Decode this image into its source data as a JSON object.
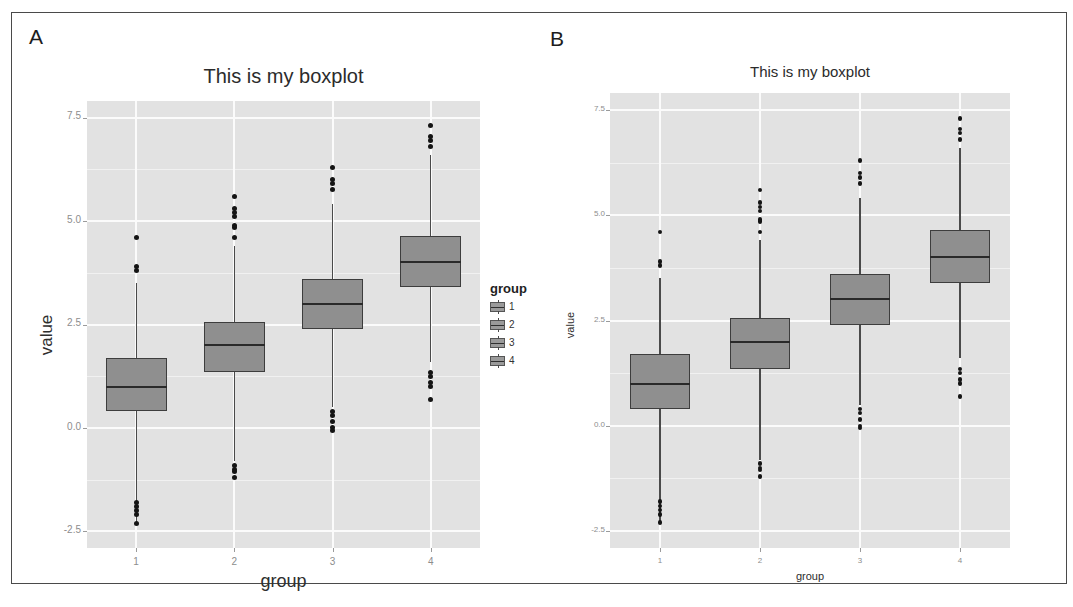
{
  "figure": {
    "panels": [
      {
        "letter": "A"
      },
      {
        "letter": "B"
      }
    ]
  },
  "chart_data": [
    {
      "panel": "A",
      "type": "boxplot",
      "title": "This is my boxplot",
      "xlabel": "group",
      "ylabel": "value",
      "categories": [
        "1",
        "2",
        "3",
        "4"
      ],
      "ytick_labels": [
        "7.5",
        "5.0",
        "2.5",
        "0.0",
        "-2.5"
      ],
      "ytick_values": [
        7.5,
        5.0,
        2.5,
        0.0,
        -2.5
      ],
      "ylim": [
        -2.9,
        7.9
      ],
      "grid": true,
      "legend": {
        "title": "group",
        "position": "right",
        "entries": [
          "1",
          "2",
          "3",
          "4"
        ]
      },
      "boxes": [
        {
          "group": "1",
          "min": -2.3,
          "q1": 0.4,
          "median": 1.0,
          "q3": 1.7,
          "max": 3.5,
          "outliers": [
            4.6,
            3.9,
            3.8,
            -1.8,
            -1.9,
            -2.0,
            -2.1,
            -2.3
          ]
        },
        {
          "group": "2",
          "min": -0.8,
          "q1": 1.35,
          "median": 2.0,
          "q3": 2.55,
          "max": 4.4,
          "outliers": [
            5.6,
            5.3,
            5.2,
            5.1,
            4.9,
            4.85,
            4.6,
            -0.9,
            -1.0,
            -1.05,
            -1.2
          ]
        },
        {
          "group": "3",
          "min": 0.5,
          "q1": 2.4,
          "median": 3.0,
          "q3": 3.6,
          "max": 5.4,
          "outliers": [
            6.3,
            6.0,
            5.9,
            5.75,
            0.4,
            0.3,
            0.15,
            0.0,
            -0.05
          ]
        },
        {
          "group": "4",
          "min": 1.6,
          "q1": 3.4,
          "median": 4.0,
          "q3": 4.65,
          "max": 6.6,
          "outliers": [
            7.3,
            7.05,
            6.95,
            6.8,
            1.35,
            1.25,
            1.1,
            1.0,
            0.7
          ]
        }
      ]
    },
    {
      "panel": "B",
      "type": "boxplot",
      "title": "This is my boxplot",
      "xlabel": "group",
      "ylabel": "value",
      "categories": [
        "1",
        "2",
        "3",
        "4"
      ],
      "ytick_labels": [
        "7.5",
        "5.0",
        "2.5",
        "0.0",
        "-2.5"
      ],
      "ytick_values": [
        7.5,
        5.0,
        2.5,
        0.0,
        -2.5
      ],
      "ylim": [
        -2.9,
        7.9
      ],
      "grid": true,
      "legend": {
        "title": "group",
        "position": "right",
        "entries": [
          "1",
          "2",
          "3",
          "4"
        ]
      },
      "boxes": [
        {
          "group": "1",
          "min": -2.3,
          "q1": 0.4,
          "median": 1.0,
          "q3": 1.7,
          "max": 3.5,
          "outliers": [
            4.6,
            3.9,
            3.8,
            -1.8,
            -1.9,
            -2.0,
            -2.1,
            -2.3
          ]
        },
        {
          "group": "2",
          "min": -0.8,
          "q1": 1.35,
          "median": 2.0,
          "q3": 2.55,
          "max": 4.4,
          "outliers": [
            5.6,
            5.3,
            5.2,
            5.1,
            4.9,
            4.85,
            4.6,
            -0.9,
            -1.0,
            -1.05,
            -1.2
          ]
        },
        {
          "group": "3",
          "min": 0.5,
          "q1": 2.4,
          "median": 3.0,
          "q3": 3.6,
          "max": 5.4,
          "outliers": [
            6.3,
            6.0,
            5.9,
            5.75,
            0.4,
            0.3,
            0.15,
            0.0,
            -0.05
          ]
        },
        {
          "group": "4",
          "min": 1.6,
          "q1": 3.4,
          "median": 4.0,
          "q3": 4.65,
          "max": 6.6,
          "outliers": [
            7.3,
            7.05,
            6.95,
            6.8,
            1.35,
            1.25,
            1.1,
            1.0,
            0.7
          ]
        }
      ]
    }
  ]
}
